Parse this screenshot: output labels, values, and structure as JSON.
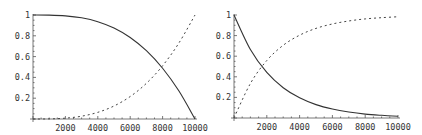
{
  "chart_data": [
    {
      "type": "line",
      "title": "",
      "xlabel": "",
      "ylabel": "",
      "xlim": [
        0,
        10000
      ],
      "ylim": [
        0,
        1
      ],
      "grid": false,
      "x_ticks": [
        "2000",
        "4000",
        "6000",
        "8000",
        "10000"
      ],
      "y_ticks": [
        "0.2",
        "0.4",
        "0.6",
        "0.8",
        "1"
      ],
      "x": [
        0,
        1000,
        2000,
        3000,
        4000,
        5000,
        6000,
        7000,
        8000,
        9000,
        10000
      ],
      "series": [
        {
          "name": "solid",
          "style": "solid",
          "values": [
            1.0,
            0.999,
            0.992,
            0.973,
            0.936,
            0.875,
            0.784,
            0.657,
            0.488,
            0.271,
            0.0
          ]
        },
        {
          "name": "dashed",
          "style": "dashed",
          "values": [
            0.0,
            0.001,
            0.008,
            0.027,
            0.064,
            0.125,
            0.216,
            0.343,
            0.512,
            0.729,
            1.0
          ]
        }
      ]
    },
    {
      "type": "line",
      "title": "",
      "xlabel": "",
      "ylabel": "",
      "xlim": [
        0,
        10000
      ],
      "ylim": [
        0,
        1
      ],
      "grid": false,
      "x_ticks": [
        "2000",
        "4000",
        "6000",
        "8000",
        "10000"
      ],
      "y_ticks": [
        "0.2",
        "0.4",
        "0.6",
        "0.8",
        "1"
      ],
      "x": [
        0,
        1000,
        2000,
        3000,
        4000,
        5000,
        6000,
        7000,
        8000,
        9000,
        10000
      ],
      "series": [
        {
          "name": "solid",
          "style": "solid",
          "values": [
            1.0,
            0.665,
            0.442,
            0.294,
            0.196,
            0.13,
            0.087,
            0.058,
            0.038,
            0.026,
            0.017
          ]
        },
        {
          "name": "dashed",
          "style": "dashed",
          "values": [
            0.0,
            0.335,
            0.558,
            0.706,
            0.804,
            0.87,
            0.913,
            0.942,
            0.962,
            0.974,
            0.983
          ]
        }
      ]
    }
  ]
}
